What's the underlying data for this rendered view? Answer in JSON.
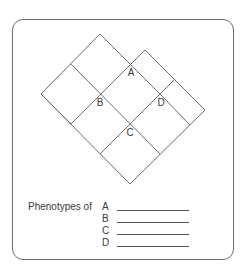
{
  "diagram": {
    "type": "overlapping-diamond-grid",
    "crossing_labels": [
      "A",
      "B",
      "C",
      "D"
    ]
  },
  "phenotypes": {
    "title": "Phenotypes of",
    "rows": [
      {
        "letter": "A",
        "answer": ""
      },
      {
        "letter": "B",
        "answer": ""
      },
      {
        "letter": "C",
        "answer": ""
      },
      {
        "letter": "D",
        "answer": ""
      }
    ]
  }
}
